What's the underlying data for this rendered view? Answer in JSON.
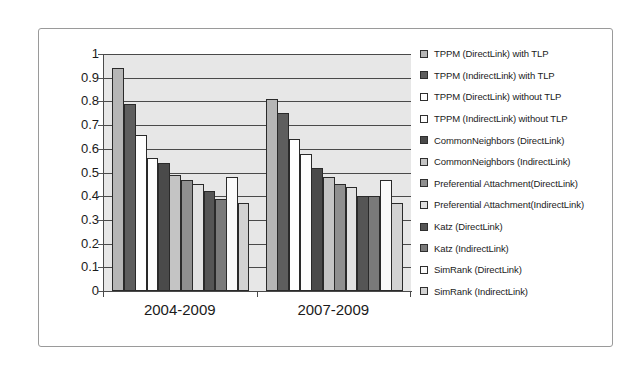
{
  "chart_data": {
    "type": "bar",
    "title": "",
    "xlabel": "",
    "ylabel": "",
    "categories": [
      "2004-2009",
      "2007-2009"
    ],
    "ylim": [
      0,
      1
    ],
    "yticks": [
      "1",
      "0.9",
      "0.8",
      "0.7",
      "0.6",
      "0.5",
      "0.4",
      "0.3",
      "0.2",
      "0.1",
      "0"
    ],
    "ytick_values": [
      1,
      0.9,
      0.8,
      0.7,
      0.6,
      0.5,
      0.4,
      0.3,
      0.2,
      0.1,
      0
    ],
    "grid": true,
    "legend_position": "right",
    "plot_background": "#e7e7e7",
    "series": [
      {
        "name": "TPPM (DirectLink) with TLP",
        "color": "#b6b6b6",
        "values": [
          0.94,
          0.81
        ]
      },
      {
        "name": "TPPM (IndirectLink) with TLP",
        "color": "#5e5e5e",
        "values": [
          0.79,
          0.75
        ]
      },
      {
        "name": "TPPM (DirectLink) without TLP",
        "color": "#ffffff",
        "values": [
          0.66,
          0.64
        ]
      },
      {
        "name": "TPPM (IndirectLink) without TLP",
        "color": "#fdfdfd",
        "values": [
          0.56,
          0.58
        ]
      },
      {
        "name": "CommonNeighbors (DirectLink)",
        "color": "#4a4a4a",
        "values": [
          0.54,
          0.52
        ]
      },
      {
        "name": "CommonNeighbors (IndirectLink)",
        "color": "#c4c4c4",
        "values": [
          0.49,
          0.48
        ]
      },
      {
        "name": "Preferential Attachment(DirectLink)",
        "color": "#8f8f8f",
        "values": [
          0.47,
          0.45
        ]
      },
      {
        "name": "Preferential Attachment(IndirectLink)",
        "color": "#e2e2e2",
        "values": [
          0.45,
          0.44
        ]
      },
      {
        "name": "Katz (DirectLink)",
        "color": "#555555",
        "values": [
          0.42,
          0.4
        ]
      },
      {
        "name": "Katz (IndirectLink)",
        "color": "#7a7a7a",
        "values": [
          0.39,
          0.4
        ]
      },
      {
        "name": "SimRank (DirectLink)",
        "color": "#fafafa",
        "values": [
          0.48,
          0.47
        ]
      },
      {
        "name": "SimRank (IndirectLink)",
        "color": "#d2d2d2",
        "values": [
          0.37,
          0.37
        ]
      }
    ]
  }
}
